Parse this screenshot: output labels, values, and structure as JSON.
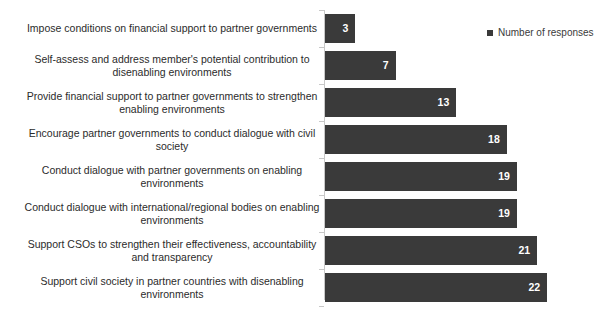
{
  "legend": {
    "position": "top-right",
    "entries": [
      {
        "label": "Number of responses",
        "marker": "square-marker",
        "color": "#3a3a3a"
      }
    ]
  },
  "colors": {
    "bar_fill": "#3a3a3a",
    "value_label": "#ffffff",
    "category_label": "#2b2b2b",
    "axis_line": "#c8c8c8",
    "background": "#ffffff"
  },
  "chart_data": {
    "type": "bar",
    "orientation": "horizontal",
    "title": "",
    "subtitle": "",
    "xlabel": "",
    "ylabel": "",
    "grid": false,
    "legend_position": "top-right",
    "xlim": [
      0,
      24
    ],
    "categories": [
      "Impose conditions on financial support to partner governments",
      "Self-assess and address member's potential contribution to disenabling environments",
      "Provide financial support to partner governments to strengthen enabling environments",
      "Encourage partner governments to conduct dialogue with civil society",
      "Conduct dialogue with partner governments on enabling environments",
      "Conduct dialogue with international/regional bodies on enabling environments",
      "Support CSOs to strengthen their effectiveness, accountability and transparency",
      "Support civil society in partner countries with disenabling environments"
    ],
    "values": [
      3,
      7,
      13,
      18,
      19,
      19,
      21,
      22
    ],
    "series": [
      {
        "name": "Number of responses",
        "values": [
          3,
          7,
          13,
          18,
          19,
          19,
          21,
          22
        ]
      }
    ],
    "value_labels": [
      "3",
      "7",
      "13",
      "18",
      "19",
      "19",
      "21",
      "22"
    ]
  }
}
